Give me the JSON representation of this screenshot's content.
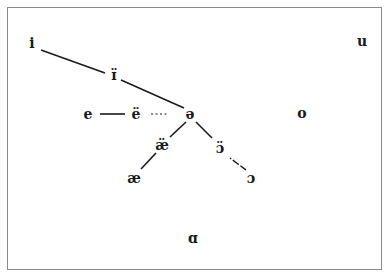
{
  "diagram": {
    "type": "vowel-chart",
    "border_color": "#8a8a8a",
    "ink_color": "#1a1a1a",
    "symbols": [
      {
        "id": "i",
        "label": "i",
        "x": 32,
        "y": 43
      },
      {
        "id": "i-centralized",
        "label": "ɪ̈",
        "x": 114,
        "y": 75
      },
      {
        "id": "u",
        "label": "u",
        "x": 362,
        "y": 41
      },
      {
        "id": "e",
        "label": "e",
        "x": 88,
        "y": 114
      },
      {
        "id": "e-umlaut",
        "label": "ë",
        "x": 136,
        "y": 114
      },
      {
        "id": "schwa",
        "label": "ə",
        "x": 190,
        "y": 114
      },
      {
        "id": "o",
        "label": "o",
        "x": 302,
        "y": 113
      },
      {
        "id": "ae-umlaut",
        "label": "æ̈",
        "x": 162,
        "y": 145
      },
      {
        "id": "open-o-umlaut",
        "label": "ɔ̈",
        "x": 220,
        "y": 148
      },
      {
        "id": "ae",
        "label": "æ",
        "x": 134,
        "y": 178
      },
      {
        "id": "open-o",
        "label": "ɔ",
        "x": 251,
        "y": 178
      },
      {
        "id": "script-a",
        "label": "ɑ",
        "x": 193,
        "y": 238
      }
    ],
    "connections": [
      {
        "from": "i",
        "to": "i-centralized",
        "style": "solid",
        "x1": 41,
        "y1": 50,
        "x2": 105,
        "y2": 73
      },
      {
        "from": "i-centralized",
        "to": "schwa",
        "style": "solid",
        "x1": 121,
        "y1": 80,
        "x2": 184,
        "y2": 108
      },
      {
        "from": "e",
        "to": "e-umlaut",
        "style": "solid",
        "x1": 100,
        "y1": 114,
        "x2": 125,
        "y2": 114
      },
      {
        "from": "e-umlaut",
        "to": "schwa",
        "style": "dotted",
        "x1": 151,
        "y1": 114,
        "x2": 167,
        "y2": 114
      },
      {
        "from": "schwa",
        "to": "ae-umlaut",
        "style": "solid",
        "x1": 186,
        "y1": 122,
        "x2": 170,
        "y2": 137
      },
      {
        "from": "schwa",
        "to": "open-o-umlaut",
        "style": "solid",
        "x1": 196,
        "y1": 122,
        "x2": 212,
        "y2": 138
      },
      {
        "from": "ae-umlaut",
        "to": "ae",
        "style": "solid",
        "x1": 156,
        "y1": 153,
        "x2": 141,
        "y2": 169
      },
      {
        "from": "open-o-umlaut",
        "to": "open-o",
        "style": "dashed",
        "x1": 230,
        "y1": 158,
        "x2": 246,
        "y2": 170
      }
    ]
  }
}
